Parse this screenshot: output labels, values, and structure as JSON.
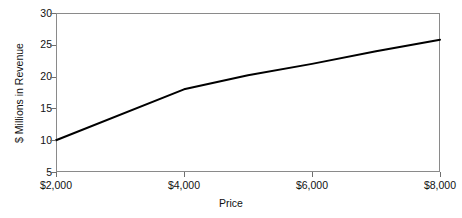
{
  "chart_data": {
    "type": "line",
    "title": "",
    "xlabel": "Price",
    "ylabel": "$ Millions in Revenue",
    "xlim": [
      2000,
      8000
    ],
    "ylim": [
      5,
      30
    ],
    "grid": false,
    "legend": null,
    "x_tick_labels": [
      "$2,000",
      "$4,000",
      "$6,000",
      "$8,000"
    ],
    "x_tick_values": [
      2000,
      4000,
      6000,
      8000
    ],
    "y_tick_labels": [
      "5",
      "10",
      "15",
      "20",
      "25",
      "30"
    ],
    "y_tick_values": [
      5,
      10,
      15,
      20,
      25,
      30
    ],
    "line_color": "#000000",
    "frame_color": "#8a8a8a",
    "background_color": "#ffffff",
    "x": [
      2000,
      4000,
      5000,
      6000,
      7000,
      8000
    ],
    "values": [
      10.0,
      18.0,
      20.2,
      22.0,
      24.0,
      25.8
    ],
    "series": [
      {
        "name": "Revenue",
        "x": [
          2000,
          4000,
          5000,
          6000,
          7000,
          8000
        ],
        "values": [
          10.0,
          18.0,
          20.2,
          22.0,
          24.0,
          25.8
        ]
      }
    ],
    "annotations": []
  },
  "axes": {
    "x_title": "Price",
    "y_title": "$ Millions in Revenue",
    "y_ticks": [
      {
        "label": "30",
        "value": 30
      },
      {
        "label": "25",
        "value": 25
      },
      {
        "label": "20",
        "value": 20
      },
      {
        "label": "15",
        "value": 15
      },
      {
        "label": "10",
        "value": 10
      },
      {
        "label": "5",
        "value": 5
      }
    ],
    "x_ticks": [
      {
        "label": "$2,000",
        "value": 2000
      },
      {
        "label": "$4,000",
        "value": 4000
      },
      {
        "label": "$6,000",
        "value": 6000
      },
      {
        "label": "$8,000",
        "value": 8000
      }
    ]
  }
}
